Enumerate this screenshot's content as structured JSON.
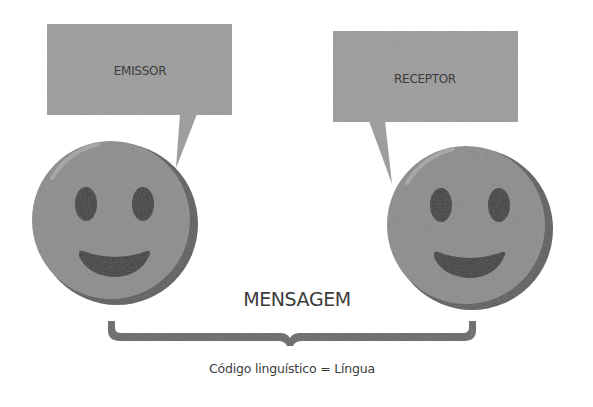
{
  "diagram": {
    "sender": {
      "label": "EMISSOR",
      "icon": "smiley-face-icon"
    },
    "receiver": {
      "label": "RECEPTOR",
      "icon": "smiley-face-icon"
    },
    "message": {
      "label": "MENSAGEM"
    },
    "code": {
      "label": "Código linguístico = Língua"
    },
    "colors": {
      "bubble": "#9b9b9b",
      "face": "#8b8b8b",
      "face_shadow": "#5c5c5c",
      "face_highlight": "#a6a6a6",
      "features": "#3b3b3b",
      "brace": "#676767",
      "text": "#3c3c3c"
    }
  }
}
